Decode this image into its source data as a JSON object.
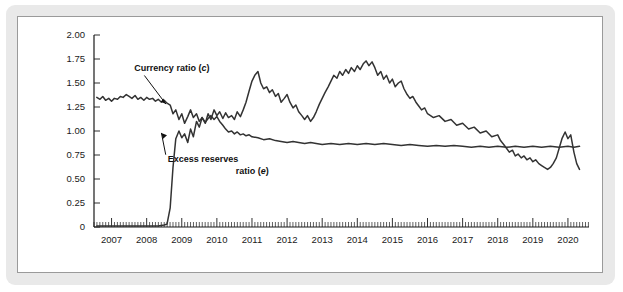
{
  "figure": {
    "background_color": "#e9e9e9",
    "panel_color": "#ffffff",
    "line_color": "#333333"
  },
  "chart_data": {
    "type": "line",
    "title": "",
    "xlabel": "",
    "ylabel": "",
    "xlim": [
      2006.5,
      2020.6
    ],
    "ylim": [
      0,
      2.0
    ],
    "grid": false,
    "legend": "none",
    "ytick_labels": [
      "0",
      "0.25",
      "0.50",
      "0.75",
      "1.00",
      "1.25",
      "1.50",
      "1.75",
      "2.00"
    ],
    "ytick_values": [
      0,
      0.25,
      0.5,
      0.75,
      1.0,
      1.25,
      1.5,
      1.75,
      2.0
    ],
    "xtick_labels": [
      "2007",
      "2008",
      "2009",
      "2010",
      "2011",
      "2012",
      "2013",
      "2014",
      "2015",
      "2016",
      "2017",
      "2018",
      "2019",
      "2020"
    ],
    "xtick_values": [
      2007,
      2008,
      2009,
      2010,
      2011,
      2012,
      2013,
      2014,
      2015,
      2016,
      2017,
      2018,
      2019,
      2020
    ],
    "minor_tick_interval": 0.0833,
    "annotations": [
      {
        "name": "currency-ratio-label",
        "text_line1": "Currency ratio (",
        "text_italic": "c",
        "text_line2": ")",
        "full_text": "Currency ratio (c)",
        "x": 2007.65,
        "y": 1.62,
        "arrow_to_x": 2008.55,
        "arrow_to_y": 1.28
      },
      {
        "name": "excess-reserves-label",
        "line1": "Excess reserves",
        "line2_prefix": "ratio (",
        "line2_italic": "e",
        "line2_suffix": ")",
        "full_text": "Excess reserves ratio (e)",
        "x": 2008.6,
        "y": 0.68,
        "arrow_to_x": 2008.42,
        "arrow_to_y": 0.98
      }
    ],
    "series": [
      {
        "name": "Currency ratio (c)",
        "symbol": "c",
        "points": [
          [
            2006.58,
            1.35
          ],
          [
            2006.67,
            1.33
          ],
          [
            2006.75,
            1.36
          ],
          [
            2006.83,
            1.32
          ],
          [
            2006.92,
            1.34
          ],
          [
            2007.0,
            1.31
          ],
          [
            2007.08,
            1.34
          ],
          [
            2007.17,
            1.33
          ],
          [
            2007.25,
            1.36
          ],
          [
            2007.33,
            1.35
          ],
          [
            2007.42,
            1.38
          ],
          [
            2007.5,
            1.36
          ],
          [
            2007.58,
            1.34
          ],
          [
            2007.67,
            1.37
          ],
          [
            2007.75,
            1.33
          ],
          [
            2007.83,
            1.35
          ],
          [
            2007.92,
            1.32
          ],
          [
            2008.0,
            1.35
          ],
          [
            2008.08,
            1.33
          ],
          [
            2008.17,
            1.34
          ],
          [
            2008.25,
            1.31
          ],
          [
            2008.33,
            1.33
          ],
          [
            2008.42,
            1.3
          ],
          [
            2008.5,
            1.32
          ],
          [
            2008.58,
            1.29
          ],
          [
            2008.67,
            1.27
          ],
          [
            2008.75,
            1.18
          ],
          [
            2008.83,
            1.22
          ],
          [
            2008.92,
            1.12
          ],
          [
            2009.0,
            1.18
          ],
          [
            2009.08,
            1.08
          ],
          [
            2009.17,
            1.15
          ],
          [
            2009.25,
            1.22
          ],
          [
            2009.33,
            1.14
          ],
          [
            2009.42,
            1.18
          ],
          [
            2009.5,
            1.1
          ],
          [
            2009.58,
            1.14
          ],
          [
            2009.67,
            1.09
          ],
          [
            2009.75,
            1.13
          ],
          [
            2009.83,
            1.16
          ],
          [
            2009.92,
            1.12
          ],
          [
            2010.0,
            1.15
          ],
          [
            2010.08,
            1.1
          ],
          [
            2010.17,
            1.06
          ],
          [
            2010.25,
            1.02
          ],
          [
            2010.33,
            0.99
          ],
          [
            2010.42,
            1.0
          ],
          [
            2010.5,
            0.97
          ],
          [
            2010.58,
            0.99
          ],
          [
            2010.67,
            0.96
          ],
          [
            2010.75,
            0.97
          ],
          [
            2010.83,
            0.95
          ],
          [
            2010.92,
            0.96
          ],
          [
            2011.0,
            0.94
          ],
          [
            2011.17,
            0.93
          ],
          [
            2011.33,
            0.91
          ],
          [
            2011.5,
            0.92
          ],
          [
            2011.67,
            0.9
          ],
          [
            2011.83,
            0.89
          ],
          [
            2012.0,
            0.88
          ],
          [
            2012.17,
            0.89
          ],
          [
            2012.33,
            0.88
          ],
          [
            2012.5,
            0.87
          ],
          [
            2012.67,
            0.88
          ],
          [
            2012.83,
            0.87
          ],
          [
            2013.0,
            0.86
          ],
          [
            2013.25,
            0.87
          ],
          [
            2013.5,
            0.86
          ],
          [
            2013.75,
            0.87
          ],
          [
            2014.0,
            0.86
          ],
          [
            2014.25,
            0.87
          ],
          [
            2014.5,
            0.86
          ],
          [
            2014.75,
            0.87
          ],
          [
            2015.0,
            0.86
          ],
          [
            2015.25,
            0.85
          ],
          [
            2015.5,
            0.86
          ],
          [
            2015.75,
            0.85
          ],
          [
            2016.0,
            0.84
          ],
          [
            2016.25,
            0.85
          ],
          [
            2016.5,
            0.84
          ],
          [
            2016.75,
            0.85
          ],
          [
            2017.0,
            0.84
          ],
          [
            2017.25,
            0.83
          ],
          [
            2017.5,
            0.84
          ],
          [
            2017.75,
            0.83
          ],
          [
            2018.0,
            0.84
          ],
          [
            2018.25,
            0.83
          ],
          [
            2018.5,
            0.84
          ],
          [
            2018.75,
            0.83
          ],
          [
            2019.0,
            0.84
          ],
          [
            2019.25,
            0.83
          ],
          [
            2019.5,
            0.84
          ],
          [
            2019.75,
            0.83
          ],
          [
            2020.0,
            0.84
          ],
          [
            2020.17,
            0.83
          ],
          [
            2020.33,
            0.84
          ]
        ]
      },
      {
        "name": "Excess reserves ratio (e)",
        "symbol": "e",
        "points": [
          [
            2006.58,
            0.01
          ],
          [
            2007.0,
            0.01
          ],
          [
            2007.5,
            0.01
          ],
          [
            2008.0,
            0.01
          ],
          [
            2008.33,
            0.01
          ],
          [
            2008.5,
            0.02
          ],
          [
            2008.58,
            0.03
          ],
          [
            2008.67,
            0.2
          ],
          [
            2008.75,
            0.62
          ],
          [
            2008.83,
            0.92
          ],
          [
            2008.92,
            1.0
          ],
          [
            2009.0,
            0.93
          ],
          [
            2009.08,
            0.97
          ],
          [
            2009.17,
            0.88
          ],
          [
            2009.25,
            1.02
          ],
          [
            2009.33,
            0.94
          ],
          [
            2009.42,
            1.1
          ],
          [
            2009.5,
            1.04
          ],
          [
            2009.58,
            1.14
          ],
          [
            2009.67,
            1.08
          ],
          [
            2009.75,
            1.18
          ],
          [
            2009.83,
            1.12
          ],
          [
            2009.92,
            1.22
          ],
          [
            2010.0,
            1.16
          ],
          [
            2010.08,
            1.2
          ],
          [
            2010.17,
            1.13
          ],
          [
            2010.25,
            1.19
          ],
          [
            2010.33,
            1.14
          ],
          [
            2010.42,
            1.16
          ],
          [
            2010.5,
            1.12
          ],
          [
            2010.58,
            1.2
          ],
          [
            2010.67,
            1.15
          ],
          [
            2010.75,
            1.22
          ],
          [
            2010.83,
            1.3
          ],
          [
            2010.92,
            1.42
          ],
          [
            2011.0,
            1.52
          ],
          [
            2011.08,
            1.58
          ],
          [
            2011.17,
            1.62
          ],
          [
            2011.25,
            1.5
          ],
          [
            2011.33,
            1.44
          ],
          [
            2011.42,
            1.46
          ],
          [
            2011.5,
            1.4
          ],
          [
            2011.58,
            1.43
          ],
          [
            2011.67,
            1.36
          ],
          [
            2011.75,
            1.39
          ],
          [
            2011.83,
            1.3
          ],
          [
            2011.92,
            1.34
          ],
          [
            2012.0,
            1.38
          ],
          [
            2012.08,
            1.3
          ],
          [
            2012.17,
            1.24
          ],
          [
            2012.25,
            1.27
          ],
          [
            2012.33,
            1.2
          ],
          [
            2012.42,
            1.16
          ],
          [
            2012.5,
            1.12
          ],
          [
            2012.58,
            1.16
          ],
          [
            2012.67,
            1.1
          ],
          [
            2012.75,
            1.14
          ],
          [
            2012.83,
            1.2
          ],
          [
            2012.92,
            1.28
          ],
          [
            2013.0,
            1.34
          ],
          [
            2013.08,
            1.4
          ],
          [
            2013.17,
            1.46
          ],
          [
            2013.25,
            1.52
          ],
          [
            2013.33,
            1.58
          ],
          [
            2013.42,
            1.55
          ],
          [
            2013.5,
            1.62
          ],
          [
            2013.58,
            1.58
          ],
          [
            2013.67,
            1.64
          ],
          [
            2013.75,
            1.6
          ],
          [
            2013.83,
            1.66
          ],
          [
            2013.92,
            1.62
          ],
          [
            2014.0,
            1.68
          ],
          [
            2014.08,
            1.64
          ],
          [
            2014.17,
            1.7
          ],
          [
            2014.25,
            1.73
          ],
          [
            2014.33,
            1.68
          ],
          [
            2014.42,
            1.72
          ],
          [
            2014.5,
            1.66
          ],
          [
            2014.58,
            1.58
          ],
          [
            2014.67,
            1.62
          ],
          [
            2014.75,
            1.54
          ],
          [
            2014.83,
            1.58
          ],
          [
            2014.92,
            1.5
          ],
          [
            2015.0,
            1.54
          ],
          [
            2015.08,
            1.46
          ],
          [
            2015.17,
            1.5
          ],
          [
            2015.25,
            1.52
          ],
          [
            2015.33,
            1.44
          ],
          [
            2015.42,
            1.38
          ],
          [
            2015.5,
            1.34
          ],
          [
            2015.58,
            1.36
          ],
          [
            2015.67,
            1.3
          ],
          [
            2015.75,
            1.26
          ],
          [
            2015.83,
            1.22
          ],
          [
            2015.92,
            1.24
          ],
          [
            2016.0,
            1.18
          ],
          [
            2016.17,
            1.14
          ],
          [
            2016.33,
            1.16
          ],
          [
            2016.5,
            1.1
          ],
          [
            2016.67,
            1.12
          ],
          [
            2016.83,
            1.06
          ],
          [
            2017.0,
            1.08
          ],
          [
            2017.17,
            1.02
          ],
          [
            2017.33,
            1.04
          ],
          [
            2017.5,
            0.98
          ],
          [
            2017.67,
            1.0
          ],
          [
            2017.83,
            0.94
          ],
          [
            2018.0,
            0.96
          ],
          [
            2018.08,
            0.9
          ],
          [
            2018.17,
            0.86
          ],
          [
            2018.25,
            0.82
          ],
          [
            2018.33,
            0.78
          ],
          [
            2018.42,
            0.8
          ],
          [
            2018.5,
            0.74
          ],
          [
            2018.58,
            0.76
          ],
          [
            2018.67,
            0.72
          ],
          [
            2018.75,
            0.74
          ],
          [
            2018.83,
            0.7
          ],
          [
            2018.92,
            0.72
          ],
          [
            2019.0,
            0.68
          ],
          [
            2019.08,
            0.7
          ],
          [
            2019.17,
            0.66
          ],
          [
            2019.25,
            0.64
          ],
          [
            2019.33,
            0.62
          ],
          [
            2019.42,
            0.6
          ],
          [
            2019.5,
            0.62
          ],
          [
            2019.58,
            0.66
          ],
          [
            2019.67,
            0.72
          ],
          [
            2019.75,
            0.82
          ],
          [
            2019.83,
            0.92
          ],
          [
            2019.92,
            0.99
          ],
          [
            2020.0,
            0.92
          ],
          [
            2020.08,
            0.96
          ],
          [
            2020.17,
            0.78
          ],
          [
            2020.25,
            0.66
          ],
          [
            2020.33,
            0.6
          ]
        ]
      }
    ]
  }
}
